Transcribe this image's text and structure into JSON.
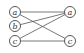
{
  "diagram": {
    "type": "bipartite-graph",
    "nodes": [
      {
        "id": "L_a",
        "label": "a",
        "x": 15,
        "y": 12
      },
      {
        "id": "L_b",
        "label": "b",
        "x": 15,
        "y": 26
      },
      {
        "id": "L_c",
        "label": "c",
        "x": 15,
        "y": 41
      },
      {
        "id": "R_a",
        "label": "a",
        "x": 70,
        "y": 12
      },
      {
        "id": "R_c",
        "label": "c",
        "x": 70,
        "y": 41
      }
    ],
    "edges": [
      {
        "from": "L_a",
        "to": "R_a"
      },
      {
        "from": "L_a",
        "to": "R_c"
      },
      {
        "from": "L_b",
        "to": "R_a"
      },
      {
        "from": "L_c",
        "to": "R_a"
      },
      {
        "from": "L_c",
        "to": "R_c"
      }
    ],
    "colors": {
      "stroke": "#444444",
      "text": "#333333",
      "background": "#ffffff"
    }
  }
}
